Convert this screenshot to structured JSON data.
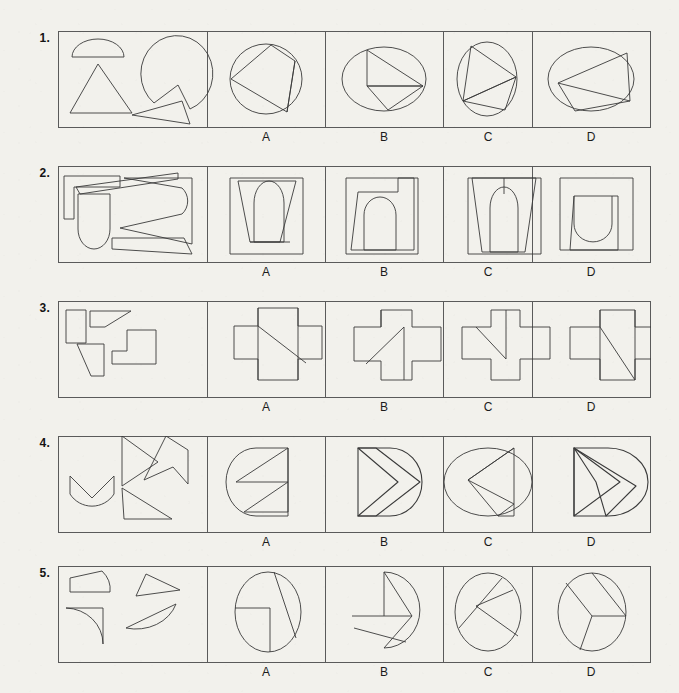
{
  "page": {
    "background_color": "#f2f1ec",
    "ink_color": "#3a3a3a",
    "text_color": "#1b1b1b",
    "type": "visual-reasoning-worksheet"
  },
  "option_labels": [
    "A",
    "B",
    "C",
    "D"
  ],
  "rows": [
    {
      "number": "1.",
      "pieces_summary": "semicircle, triangle, notched pac-shape, curved triangle",
      "options": [
        {
          "label": "A",
          "shape_summary": "circle with inscribed triangle and chord"
        },
        {
          "label": "B",
          "shape_summary": "wide ellipse with triangle and chord"
        },
        {
          "label": "C",
          "shape_summary": "tall ellipse with triangle"
        },
        {
          "label": "D",
          "shape_summary": "wide ellipse with quadrilateral and chord"
        }
      ]
    },
    {
      "number": "2.",
      "pieces_summary": "bent L-strip, rounded-bottom tab, open C-shape, thin wedge",
      "options": [
        {
          "label": "A",
          "shape_summary": "square with trapezoid and arch"
        },
        {
          "label": "B",
          "shape_summary": "square with trapezoid and arch, offset top"
        },
        {
          "label": "C",
          "shape_summary": "square with tapering trapezoid and arch"
        },
        {
          "label": "D",
          "shape_summary": "square with trapezoid and inverted arch"
        }
      ]
    },
    {
      "number": "3.",
      "pieces_summary": "small rectangle, slanted bar, trapezoid, step polygon",
      "options": [
        {
          "label": "A",
          "shape_summary": "cross of rectangles with diagonal"
        },
        {
          "label": "B",
          "shape_summary": "cross of rectangles with diagonal and vertical line"
        },
        {
          "label": "C",
          "shape_summary": "cross of rectangles with vertical and slanted line"
        },
        {
          "label": "D",
          "shape_summary": "cross of rectangles with long diagonal"
        }
      ]
    },
    {
      "number": "4.",
      "pieces_summary": "crescent V, arrow triangle, zigzag chevron, thin sliver",
      "options": [
        {
          "label": "A",
          "shape_summary": "ellipse-rectangle with single chevron notch"
        },
        {
          "label": "B",
          "shape_summary": "ellipse-rectangle with double chevron"
        },
        {
          "label": "C",
          "shape_summary": "ellipse with inward arrow notch"
        },
        {
          "label": "D",
          "shape_summary": "ellipse-rectangle with nested chevrons"
        }
      ]
    },
    {
      "number": "5.",
      "pieces_summary": "curved trapezoid, thin triangle, quarter sector, half-lens",
      "options": [
        {
          "label": "A",
          "shape_summary": "circle split into three regions"
        },
        {
          "label": "B",
          "shape_summary": "circle with vertical line and two chords"
        },
        {
          "label": "C",
          "shape_summary": "ellipse with three radiating chords"
        },
        {
          "label": "D",
          "shape_summary": "circle with T-junction and chords"
        }
      ]
    }
  ]
}
